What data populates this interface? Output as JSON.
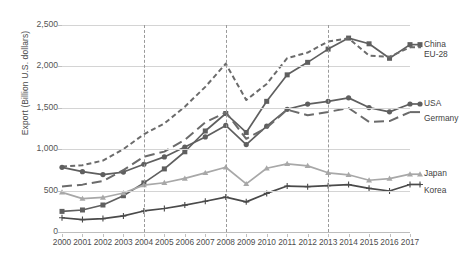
{
  "chart_data": {
    "type": "line",
    "title": "",
    "xlabel": "",
    "ylabel": "Export (Billion U.S. dollars)",
    "x": [
      2000,
      2001,
      2002,
      2003,
      2004,
      2005,
      2006,
      2007,
      2008,
      2009,
      2010,
      2011,
      2012,
      2013,
      2014,
      2015,
      2016,
      2017
    ],
    "categories": [
      "2000",
      "2001",
      "2002",
      "2003",
      "2004",
      "2005",
      "2006",
      "2007",
      "2008",
      "2009",
      "2010",
      "2011",
      "2012",
      "2013",
      "2014",
      "2015",
      "2016",
      "2017"
    ],
    "ylim": [
      0,
      2500
    ],
    "yticks": [
      0,
      500,
      1000,
      1500,
      2000,
      2500
    ],
    "ytick_labels": [
      "0",
      "500",
      "1,000",
      "1,500",
      "2,000",
      "2,500"
    ],
    "grid": true,
    "legend_position": "right",
    "reference_lines": [
      {
        "x": 2004,
        "style": "dashed"
      },
      {
        "x": 2008,
        "style": "dashed"
      },
      {
        "x": 2013,
        "style": "dashed"
      }
    ],
    "series": [
      {
        "name": "China",
        "color": "#5f5f5f",
        "marker": "square",
        "dash": "solid",
        "values": [
          249,
          266,
          326,
          438,
          593,
          762,
          969,
          1220,
          1431,
          1202,
          1578,
          1898,
          2049,
          2209,
          2342,
          2273,
          2098,
          2263
        ]
      },
      {
        "name": "EU-28",
        "color": "#6b6b6b",
        "marker": "none",
        "dash": "short-dash",
        "values": [
          790,
          806,
          863,
          1001,
          1180,
          1311,
          1513,
          1753,
          2033,
          1594,
          1788,
          2100,
          2167,
          2300,
          2340,
          2130,
          2116,
          2231
        ]
      },
      {
        "name": "USA",
        "color": "#5f5f5f",
        "marker": "circle",
        "dash": "solid",
        "values": [
          781,
          729,
          693,
          724,
          818,
          907,
          1026,
          1148,
          1287,
          1056,
          1278,
          1482,
          1545,
          1578,
          1620,
          1503,
          1451,
          1546
        ]
      },
      {
        "name": "Germany",
        "color": "#6b6b6b",
        "marker": "none",
        "dash": "long-dash",
        "values": [
          550,
          572,
          616,
          748,
          909,
          971,
          1112,
          1323,
          1446,
          1126,
          1259,
          1477,
          1410,
          1450,
          1498,
          1329,
          1340,
          1448
        ]
      },
      {
        "name": "Japan",
        "color": "#a8a8a8",
        "marker": "triangle",
        "dash": "solid",
        "values": [
          479,
          403,
          417,
          471,
          566,
          595,
          647,
          714,
          782,
          581,
          770,
          823,
          799,
          715,
          691,
          625,
          645,
          698
        ]
      },
      {
        "name": "Korea",
        "color": "#4a4a4a",
        "marker": "plus",
        "dash": "solid",
        "values": [
          172,
          150,
          162,
          194,
          254,
          284,
          325,
          371,
          422,
          364,
          466,
          555,
          548,
          560,
          573,
          527,
          495,
          574
        ]
      }
    ]
  },
  "axis": {
    "y_title": "Export (Billion U.S. dollars)",
    "y_ticks": [
      "2,500",
      "2,000",
      "1,500",
      "1,000",
      "500",
      "0"
    ]
  },
  "legend": {
    "items": [
      {
        "label": "China",
        "marker": "square-marker"
      },
      {
        "label": "EU-28",
        "marker": "dashed-line-marker"
      },
      {
        "label": "USA",
        "marker": "circle-marker"
      },
      {
        "label": "Germany",
        "marker": "long-dash-line-marker"
      },
      {
        "label": "Japan",
        "marker": "triangle-marker"
      },
      {
        "label": "Korea",
        "marker": "plus-marker"
      }
    ]
  },
  "caption": ""
}
